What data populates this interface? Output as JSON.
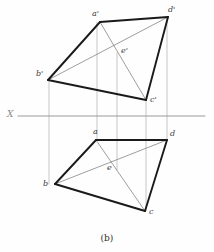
{
  "figure": {
    "caption": "(b)",
    "axis": {
      "name": "X",
      "label": "X",
      "y": 116,
      "x_start": 18,
      "x_end": 205,
      "color": "#9a9a9a"
    },
    "colors": {
      "outline": "#1a1a1a",
      "thin": "#7d7d7d",
      "projector": "#b0b0b0",
      "label": "#3a3a3a",
      "axis": "#9a9a9a",
      "background": "#fefefe"
    },
    "views": [
      {
        "name": "front-view",
        "points": {
          "a'": [
            100,
            22
          ],
          "b'": [
            48,
            80
          ],
          "c'": [
            146,
            100
          ],
          "d'": [
            168,
            17
          ],
          "e'": [
            117,
            53
          ]
        },
        "outline": [
          "b'",
          "a'",
          "d'",
          "c'",
          "b'"
        ],
        "diagonals": [
          [
            "b'",
            "d'"
          ],
          [
            "a'",
            "c'"
          ]
        ],
        "labels": [
          {
            "name": "label-a-prime",
            "text": "a'",
            "x": 92,
            "y": 10
          },
          {
            "name": "label-b-prime",
            "text": "b'",
            "x": 36,
            "y": 70
          },
          {
            "name": "label-c-prime",
            "text": "c'",
            "x": 150,
            "y": 96
          },
          {
            "name": "label-d-prime",
            "text": "d'",
            "x": 168,
            "y": 6
          },
          {
            "name": "label-e-prime",
            "text": "e'",
            "x": 121,
            "y": 47
          }
        ]
      },
      {
        "name": "top-view",
        "points": {
          "a": [
            96,
            140
          ],
          "b": [
            55,
            184
          ],
          "c": [
            145,
            211
          ],
          "d": [
            167,
            140
          ],
          "e": [
            117,
            170
          ]
        },
        "outline": [
          "a",
          "d",
          "c",
          "b",
          "a"
        ],
        "diagonals": [
          [
            "a",
            "c"
          ],
          [
            "b",
            "d"
          ]
        ],
        "labels": [
          {
            "name": "label-a",
            "text": "a",
            "x": 93,
            "y": 128
          },
          {
            "name": "label-b",
            "text": "b",
            "x": 43,
            "y": 180
          },
          {
            "name": "label-c",
            "text": "c",
            "x": 149,
            "y": 208
          },
          {
            "name": "label-d",
            "text": "d",
            "x": 170,
            "y": 130
          },
          {
            "name": "label-e",
            "text": "e",
            "x": 107,
            "y": 164
          }
        ]
      }
    ],
    "projectors": [
      {
        "name": "projector-b",
        "x": 49,
        "y1": 80,
        "y2": 184
      },
      {
        "name": "projector-a",
        "x": 97,
        "y1": 22,
        "y2": 140
      },
      {
        "name": "projector-e",
        "x": 117,
        "y1": 53,
        "y2": 170
      },
      {
        "name": "projector-c",
        "x": 146,
        "y1": 100,
        "y2": 211
      },
      {
        "name": "projector-d",
        "x": 167,
        "y1": 17,
        "y2": 140
      }
    ],
    "caption_pos": {
      "x": 107,
      "y": 234
    }
  }
}
